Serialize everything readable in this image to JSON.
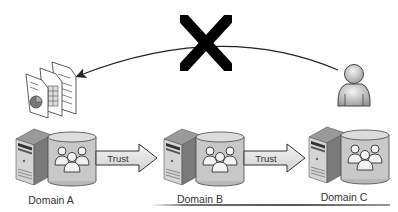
{
  "diagram": {
    "type": "trust-relationship",
    "nodes": [
      {
        "id": "domainA",
        "label": "Domain A"
      },
      {
        "id": "domainB",
        "label": "Domain B"
      },
      {
        "id": "domainC",
        "label": "Domain C"
      }
    ],
    "edges": [
      {
        "from": "domainA",
        "to": "domainB",
        "label": "Trust"
      },
      {
        "from": "domainB",
        "to": "domainC",
        "label": "Trust"
      }
    ],
    "access_attempt": {
      "from": "user",
      "to": "resources",
      "blocked": true,
      "blocked_marker": "X"
    },
    "icons": {
      "user": "user-icon",
      "resources": "documents-icon",
      "server": "server-icon",
      "group": "user-group-icon",
      "blocked": "cross-icon"
    }
  }
}
